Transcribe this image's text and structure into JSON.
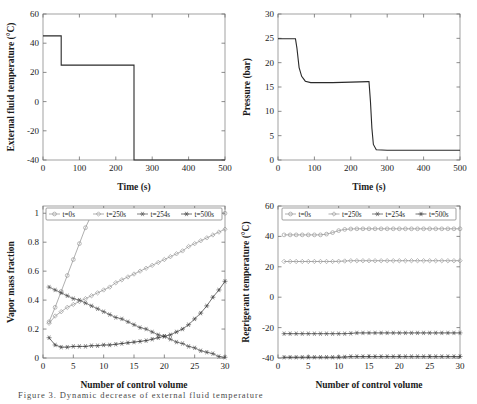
{
  "figure": {
    "caption": "Figure 3. Dynamic decrease of external fluid temperature"
  },
  "panels": {
    "top_left": {
      "ylabel": "External fluid temperature (°C)",
      "xlabel": "Time (s)",
      "xticks": [
        "0",
        "100",
        "200",
        "300",
        "400",
        "500"
      ],
      "yticks": [
        "-40",
        "-20",
        "0",
        "20",
        "40",
        "60"
      ]
    },
    "top_right": {
      "ylabel": "Pressure (bar)",
      "xlabel": "Time (s)",
      "xticks": [
        "0",
        "100",
        "200",
        "300",
        "400",
        "500"
      ],
      "yticks": [
        "0",
        "5",
        "10",
        "15",
        "20",
        "25",
        "30"
      ]
    },
    "bottom_left": {
      "ylabel": "Vapor mass fraction",
      "xlabel": "Number of control volume",
      "xticks": [
        "0",
        "5",
        "10",
        "15",
        "20",
        "25",
        "30"
      ],
      "yticks": [
        "0",
        "0.2",
        "0.4",
        "0.6",
        "0.8",
        "1"
      ],
      "legend": [
        "t=0s",
        "t=250s",
        "t=254s",
        "t=500s"
      ]
    },
    "bottom_right": {
      "ylabel": "Regrigerant temperature (°C)",
      "xlabel": "Number of control volume",
      "xticks": [
        "0",
        "5",
        "10",
        "15",
        "20",
        "25",
        "30"
      ],
      "yticks": [
        "-40",
        "-20",
        "0",
        "20",
        "40",
        "60"
      ],
      "legend": [
        "t=0s",
        "t=250s",
        "t=254s",
        "t=500s"
      ]
    }
  },
  "chart_data": [
    {
      "id": "external-fluid-temperature",
      "type": "line",
      "title": "",
      "xlabel": "Time (s)",
      "ylabel": "External fluid temperature (°C)",
      "xlim": [
        0,
        500
      ],
      "ylim": [
        -40,
        60
      ],
      "xticks": [
        0,
        100,
        200,
        300,
        400,
        500
      ],
      "yticks": [
        -40,
        -20,
        0,
        20,
        40,
        60
      ],
      "grid": false,
      "legend": "none",
      "series": [
        {
          "name": "External fluid temperature",
          "x": [
            0,
            50,
            50,
            250,
            250,
            500
          ],
          "values": [
            45,
            45,
            25,
            25,
            -40,
            -40
          ]
        }
      ]
    },
    {
      "id": "pressure",
      "type": "line",
      "title": "",
      "xlabel": "Time (s)",
      "ylabel": "Pressure (bar)",
      "xlim": [
        0,
        500
      ],
      "ylim": [
        0,
        30
      ],
      "xticks": [
        0,
        100,
        200,
        300,
        400,
        500
      ],
      "yticks": [
        0,
        5,
        10,
        15,
        20,
        25,
        30
      ],
      "grid": false,
      "legend": "none",
      "series": [
        {
          "name": "Pressure",
          "x": [
            0,
            48,
            52,
            58,
            65,
            75,
            90,
            150,
            200,
            248,
            250,
            254,
            258,
            262,
            270,
            300,
            400,
            500
          ],
          "values": [
            24.9,
            24.9,
            23.0,
            19.0,
            17.2,
            16.2,
            15.9,
            15.9,
            16.0,
            16.1,
            16.1,
            12.0,
            6.5,
            3.2,
            2.1,
            2.0,
            2.0,
            2.0
          ]
        }
      ]
    },
    {
      "id": "vapor-mass-fraction",
      "type": "line",
      "title": "",
      "xlabel": "Number of control volume",
      "ylabel": "Vapor mass fraction",
      "xlim": [
        0,
        30
      ],
      "ylim": [
        0,
        1.05
      ],
      "xticks": [
        0,
        5,
        10,
        15,
        20,
        25,
        30
      ],
      "yticks": [
        0,
        0.2,
        0.4,
        0.6,
        0.8,
        1
      ],
      "grid": false,
      "legend": "top-inside",
      "x": [
        1,
        2,
        3,
        4,
        5,
        6,
        7,
        8,
        9,
        10,
        11,
        12,
        13,
        14,
        15,
        16,
        17,
        18,
        19,
        20,
        21,
        22,
        23,
        24,
        25,
        26,
        27,
        28,
        29,
        30
      ],
      "series": [
        {
          "name": "t=0s",
          "marker": "circle",
          "values": [
            0.25,
            0.35,
            0.46,
            0.57,
            0.68,
            0.79,
            0.9,
            0.99,
            1.0,
            1.0,
            1.0,
            1.0,
            1.0,
            1.0,
            1.0,
            1.0,
            1.0,
            1.0,
            1.0,
            1.0,
            1.0,
            1.0,
            1.0,
            1.0,
            1.0,
            1.0,
            1.0,
            1.0,
            1.0,
            1.0
          ]
        },
        {
          "name": "t=250s",
          "marker": "diamond",
          "values": [
            0.24,
            0.29,
            0.32,
            0.35,
            0.37,
            0.39,
            0.41,
            0.43,
            0.45,
            0.47,
            0.49,
            0.52,
            0.54,
            0.56,
            0.58,
            0.6,
            0.62,
            0.64,
            0.66,
            0.68,
            0.7,
            0.72,
            0.74,
            0.77,
            0.79,
            0.81,
            0.83,
            0.85,
            0.87,
            0.89
          ]
        },
        {
          "name": "t=254s",
          "marker": "star",
          "values": [
            0.49,
            0.47,
            0.45,
            0.43,
            0.41,
            0.4,
            0.38,
            0.36,
            0.34,
            0.32,
            0.3,
            0.28,
            0.27,
            0.25,
            0.23,
            0.21,
            0.2,
            0.18,
            0.16,
            0.15,
            0.13,
            0.11,
            0.1,
            0.08,
            0.07,
            0.05,
            0.04,
            0.03,
            0.01,
            0.005
          ]
        },
        {
          "name": "t=500s",
          "marker": "asterisk",
          "values": [
            0.14,
            0.09,
            0.075,
            0.075,
            0.08,
            0.08,
            0.08,
            0.085,
            0.085,
            0.09,
            0.09,
            0.095,
            0.1,
            0.105,
            0.11,
            0.115,
            0.12,
            0.13,
            0.14,
            0.15,
            0.16,
            0.18,
            0.2,
            0.23,
            0.27,
            0.31,
            0.36,
            0.42,
            0.47,
            0.53
          ]
        }
      ]
    },
    {
      "id": "refrigerant-temperature",
      "type": "line",
      "title": "",
      "xlabel": "Number of control volume",
      "ylabel": "Regrigerant temperature (°C)",
      "xlim": [
        0,
        30
      ],
      "ylim": [
        -40,
        60
      ],
      "xticks": [
        0,
        5,
        10,
        15,
        20,
        25,
        30
      ],
      "yticks": [
        -40,
        -20,
        0,
        20,
        40,
        60
      ],
      "grid": false,
      "legend": "top-inside",
      "x": [
        1,
        2,
        3,
        4,
        5,
        6,
        7,
        8,
        9,
        10,
        11,
        12,
        13,
        14,
        15,
        16,
        17,
        18,
        19,
        20,
        21,
        22,
        23,
        24,
        25,
        26,
        27,
        28,
        29,
        30
      ],
      "series": [
        {
          "name": "t=0s",
          "marker": "circle",
          "values": [
            41,
            41,
            41,
            41,
            41,
            41,
            41,
            41.5,
            42.5,
            43.8,
            44.6,
            44.9,
            45,
            45,
            45,
            45,
            45,
            45,
            45,
            45,
            45,
            45,
            45,
            45,
            45,
            45,
            45,
            45,
            45,
            45
          ]
        },
        {
          "name": "t=250s",
          "marker": "diamond",
          "values": [
            23.5,
            23.5,
            23.5,
            23.5,
            23.5,
            23.5,
            23.5,
            23.5,
            23.5,
            23.6,
            23.8,
            24,
            24,
            24,
            24,
            24,
            24,
            24,
            24,
            24,
            24,
            24,
            24,
            24,
            24,
            24,
            24,
            24,
            24,
            24
          ]
        },
        {
          "name": "t=254s",
          "marker": "star",
          "values": [
            -24,
            -24,
            -24,
            -24,
            -24,
            -24,
            -24,
            -24,
            -24,
            -24,
            -24,
            -23.8,
            -23.5,
            -23.5,
            -23.5,
            -23.5,
            -23.5,
            -23.5,
            -23.5,
            -23.5,
            -23.5,
            -23.5,
            -23.5,
            -23.5,
            -23.5,
            -23.5,
            -23.5,
            -23.5,
            -23.5,
            -23.5
          ]
        },
        {
          "name": "t=500s",
          "marker": "asterisk",
          "values": [
            -39.5,
            -39.5,
            -39.5,
            -39.5,
            -39.5,
            -39.5,
            -39.5,
            -39.5,
            -39.5,
            -39.5,
            -39.3,
            -39,
            -39,
            -39,
            -39,
            -39,
            -39,
            -39,
            -39,
            -39,
            -39,
            -39,
            -39,
            -39,
            -39,
            -39,
            -39,
            -39,
            -39,
            -39
          ]
        }
      ]
    }
  ]
}
